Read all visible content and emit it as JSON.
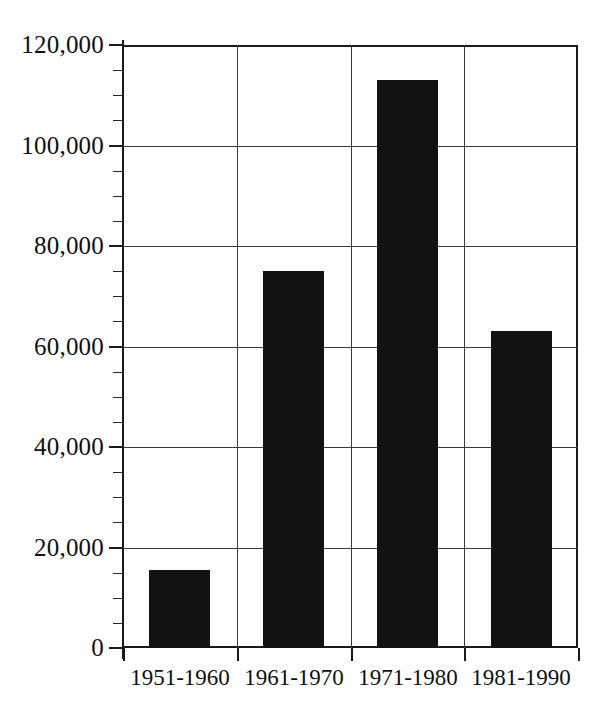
{
  "chart_data": {
    "type": "bar",
    "title": "",
    "xlabel": "",
    "ylabel": "",
    "categories": [
      "1951-1960",
      "1961-1970",
      "1971-1980",
      "1981-1990"
    ],
    "values": [
      15500,
      75000,
      113000,
      63000
    ],
    "ylim": [
      0,
      120000
    ],
    "ytick_labels": [
      "0",
      "20,000",
      "40,000",
      "60,000",
      "80,000",
      "100,000",
      "120,000"
    ],
    "ytick_values": [
      0,
      20000,
      40000,
      60000,
      80000,
      100000,
      120000
    ],
    "minor_tick_interval": 5000,
    "grid": true,
    "legend": null,
    "bar_color": "#121212",
    "axis_color": "#1a1a1a",
    "grid_color": "#3a3a3a",
    "background_color": "#ffffff"
  }
}
